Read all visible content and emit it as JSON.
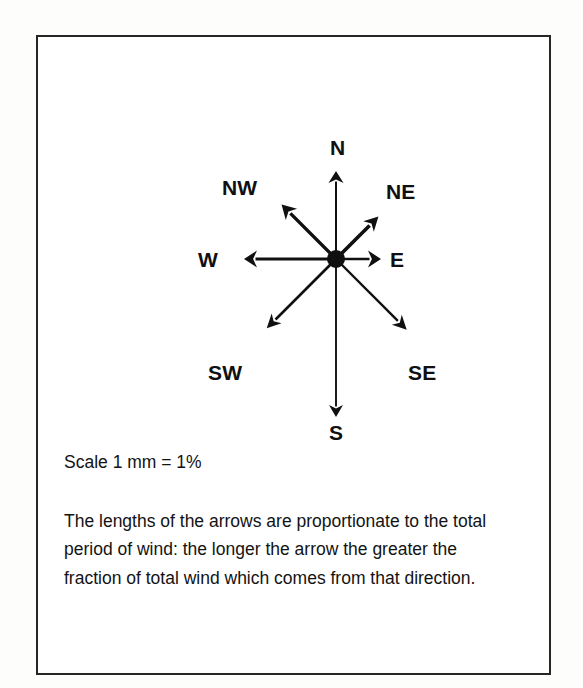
{
  "figure": {
    "type": "wind-rose-diagram",
    "border_color": "#262626",
    "ink_color": "#101010",
    "background": "#ffffff"
  },
  "compass": {
    "center": {
      "x": 298,
      "y": 222
    },
    "hub_radius": 9,
    "directions": [
      {
        "code": "N",
        "label": "N",
        "angle_deg": 0,
        "length": 88,
        "shaft_width": 2.0,
        "head_width": 15,
        "head_length": 12,
        "label_x": 292,
        "label_y": 100
      },
      {
        "code": "NE",
        "label": "NE",
        "angle_deg": 45,
        "length": 60,
        "shaft_width": 3.6,
        "head_width": 15,
        "head_length": 14,
        "label_x": 348,
        "label_y": 144
      },
      {
        "code": "E",
        "label": "E",
        "angle_deg": 90,
        "length": 45,
        "shaft_width": 2.6,
        "head_width": 17,
        "head_length": 13,
        "label_x": 352,
        "label_y": 212
      },
      {
        "code": "SE",
        "label": "SE",
        "angle_deg": 135,
        "length": 100,
        "shaft_width": 2.4,
        "head_width": 14,
        "head_length": 14,
        "label_x": 370,
        "label_y": 325
      },
      {
        "code": "S",
        "label": "S",
        "angle_deg": 180,
        "length": 158,
        "shaft_width": 1.9,
        "head_width": 14,
        "head_length": 12,
        "label_x": 291,
        "label_y": 385
      },
      {
        "code": "SW",
        "label": "SW",
        "angle_deg": 225,
        "length": 98,
        "shaft_width": 2.6,
        "head_width": 14,
        "head_length": 14,
        "label_x": 170,
        "label_y": 325
      },
      {
        "code": "W",
        "label": "W",
        "angle_deg": 270,
        "length": 92,
        "shaft_width": 3.0,
        "head_width": 17,
        "head_length": 13,
        "label_x": 160,
        "label_y": 212
      },
      {
        "code": "NW",
        "label": "NW",
        "angle_deg": 315,
        "length": 77,
        "shaft_width": 3.4,
        "head_width": 16,
        "head_length": 14,
        "label_x": 184,
        "label_y": 140
      }
    ]
  },
  "caption": {
    "scale_note": "Scale 1 mm = 1%",
    "description": "The lengths of the arrows are proportionate to the total period of wind: the longer the arrow the greater the fraction of total wind which comes from that direction."
  },
  "chart_data": {
    "type": "wind-rose",
    "title": "",
    "subtitle": "",
    "xlabel": "",
    "ylabel": "",
    "units": "%",
    "scale_text": "Scale 1 mm = 1%",
    "scale_mm_per_percent": 1,
    "grid": false,
    "legend_position": "none",
    "annotations": [
      "Scale 1 mm = 1%",
      "The lengths of the arrows are proportionate to the total period of wind: the longer the arrow the greater the fraction of total wind which comes from that direction."
    ],
    "categories": [
      "N",
      "NE",
      "E",
      "SE",
      "S",
      "SW",
      "W",
      "NW"
    ],
    "values": [
      88,
      60,
      45,
      100,
      158,
      98,
      92,
      77
    ],
    "value_description": "Arrow length in pixels, proportional to percentage of total wind period from that direction"
  }
}
